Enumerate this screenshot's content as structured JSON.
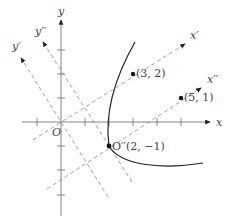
{
  "diagram": {
    "axes": {
      "x_label": "x",
      "y_label": "y",
      "origin_label": "O"
    },
    "rotated_axes": {
      "x1_label": "x′",
      "y1_label": "y′",
      "x2_label": "x′′",
      "y2_label": "y′′"
    },
    "points": [
      {
        "label": "(3, 2)",
        "x": 3,
        "y": 2
      },
      {
        "label": "(5, 1)",
        "x": 5,
        "y": 1
      },
      {
        "label": "O′′(2, −1)",
        "x": 2,
        "y": -1
      }
    ],
    "curve": "parabola opening right with vertex O′′(2, −1)",
    "colors": {
      "axis": "#555555",
      "dashed": "#888888",
      "curve": "#222222"
    }
  }
}
